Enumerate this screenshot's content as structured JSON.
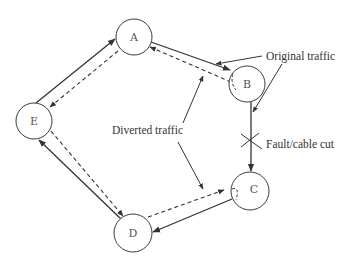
{
  "diagram": {
    "nodes": [
      {
        "id": "A",
        "label": "A",
        "x": 134,
        "y": 37
      },
      {
        "id": "B",
        "label": "B",
        "x": 247,
        "y": 84
      },
      {
        "id": "C",
        "label": "C",
        "x": 250,
        "y": 191
      },
      {
        "id": "D",
        "label": "D",
        "x": 133,
        "y": 233
      },
      {
        "id": "E",
        "label": "E",
        "x": 34,
        "y": 121
      }
    ],
    "edges": {
      "original_traffic": [
        "B->C (cut)",
        "C->D",
        "D->E",
        "E->A",
        "A->B"
      ],
      "diverted_traffic": [
        "B->A",
        "A->E",
        "E->D",
        "D->C"
      ]
    },
    "labels": {
      "original_traffic": "Original traffic",
      "diverted_traffic": "Diverted traffic",
      "fault": "Fault/cable cut"
    }
  }
}
